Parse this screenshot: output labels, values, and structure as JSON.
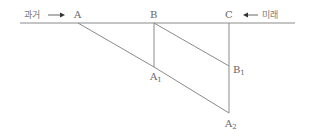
{
  "diagram": {
    "timeline": {
      "left_label": "과거",
      "right_label": "미래"
    },
    "points": {
      "A": "A",
      "B": "B",
      "C": "C",
      "A1": {
        "base": "A",
        "sub": "1"
      },
      "B1": {
        "base": "B",
        "sub": "1"
      },
      "A2": {
        "base": "A",
        "sub": "2"
      }
    },
    "colors": {
      "line": "#8a8a8a",
      "text": "#666666"
    }
  }
}
